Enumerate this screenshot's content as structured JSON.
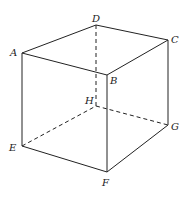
{
  "diagram": {
    "vertices": {
      "A": {
        "label": "A",
        "x": 22,
        "y": 53
      },
      "B": {
        "label": "B",
        "x": 107,
        "y": 75
      },
      "C": {
        "label": "C",
        "x": 168,
        "y": 40
      },
      "D": {
        "label": "D",
        "x": 96,
        "y": 25
      },
      "E": {
        "label": "E",
        "x": 22,
        "y": 146
      },
      "F": {
        "label": "F",
        "x": 107,
        "y": 172
      },
      "G": {
        "label": "G",
        "x": 168,
        "y": 125
      },
      "H": {
        "label": "H",
        "x": 96,
        "y": 106
      }
    },
    "visible_edges": [
      "AB",
      "BC",
      "CD",
      "DA",
      "AE",
      "BF",
      "CG",
      "EF",
      "FG"
    ],
    "hidden_edges": [
      "DH",
      "EH",
      "HG"
    ]
  }
}
